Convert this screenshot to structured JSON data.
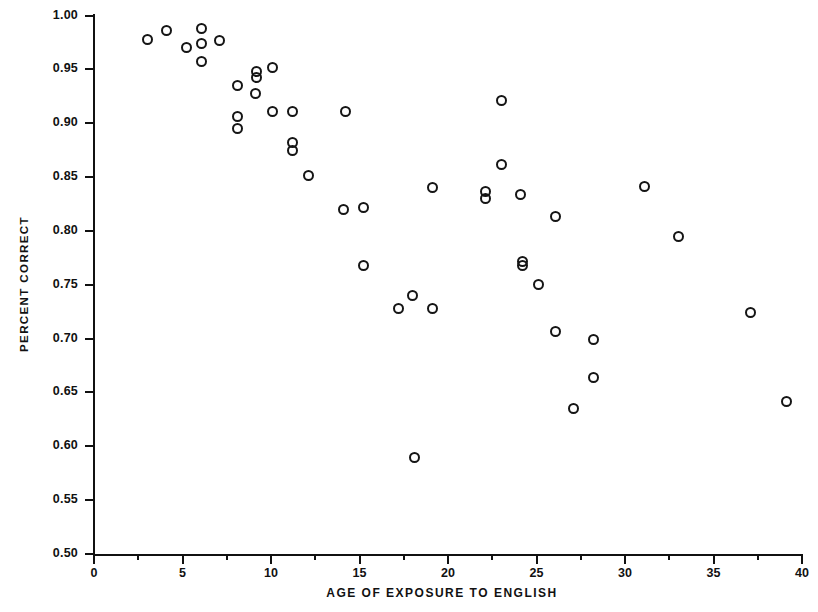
{
  "chart_data": {
    "type": "scatter",
    "title": "",
    "xlabel": "AGE OF EXPOSURE TO ENGLISH",
    "ylabel": "PERCENT CORRECT",
    "xlim": [
      0,
      40
    ],
    "ylim": [
      0.5,
      1.0
    ],
    "grid": false,
    "legend": null,
    "x_ticks": [
      {
        "value": 0,
        "label": "0",
        "major": true
      },
      {
        "value": 2.5,
        "label": "",
        "major": false
      },
      {
        "value": 5,
        "label": "5",
        "major": true
      },
      {
        "value": 7.5,
        "label": "",
        "major": false
      },
      {
        "value": 10,
        "label": "10",
        "major": true
      },
      {
        "value": 12.5,
        "label": "",
        "major": false
      },
      {
        "value": 15,
        "label": "15",
        "major": true
      },
      {
        "value": 17.5,
        "label": "",
        "major": false
      },
      {
        "value": 20,
        "label": "20",
        "major": true
      },
      {
        "value": 22.5,
        "label": "",
        "major": false
      },
      {
        "value": 25,
        "label": "25",
        "major": true
      },
      {
        "value": 27.5,
        "label": "",
        "major": false
      },
      {
        "value": 30,
        "label": "30",
        "major": true
      },
      {
        "value": 32.5,
        "label": "",
        "major": false
      },
      {
        "value": 35,
        "label": "35",
        "major": true
      },
      {
        "value": 37.5,
        "label": "",
        "major": false
      },
      {
        "value": 40,
        "label": "40",
        "major": true
      }
    ],
    "y_ticks": [
      {
        "value": 1.0,
        "label": "1.00"
      },
      {
        "value": 0.95,
        "label": "0.95"
      },
      {
        "value": 0.9,
        "label": "0.90"
      },
      {
        "value": 0.85,
        "label": "0.85"
      },
      {
        "value": 0.8,
        "label": "0.80"
      },
      {
        "value": 0.75,
        "label": "0.75"
      },
      {
        "value": 0.7,
        "label": "0.70"
      },
      {
        "value": 0.65,
        "label": "0.65"
      },
      {
        "value": 0.6,
        "label": "0.60"
      },
      {
        "value": 0.55,
        "label": "0.55"
      },
      {
        "value": 0.5,
        "label": "0.50"
      }
    ],
    "marker": {
      "shape": "open-circle",
      "color": "#151515",
      "size": 11
    },
    "points": [
      {
        "x": 3.0,
        "y": 0.978
      },
      {
        "x": 4.1,
        "y": 0.986
      },
      {
        "x": 5.2,
        "y": 0.97
      },
      {
        "x": 6.1,
        "y": 0.988
      },
      {
        "x": 6.1,
        "y": 0.974
      },
      {
        "x": 7.1,
        "y": 0.977
      },
      {
        "x": 6.1,
        "y": 0.957
      },
      {
        "x": 8.1,
        "y": 0.935
      },
      {
        "x": 8.1,
        "y": 0.906
      },
      {
        "x": 8.1,
        "y": 0.895
      },
      {
        "x": 9.1,
        "y": 0.928
      },
      {
        "x": 9.2,
        "y": 0.948
      },
      {
        "x": 9.2,
        "y": 0.942
      },
      {
        "x": 10.1,
        "y": 0.952
      },
      {
        "x": 10.1,
        "y": 0.911
      },
      {
        "x": 11.2,
        "y": 0.911
      },
      {
        "x": 11.2,
        "y": 0.882
      },
      {
        "x": 11.2,
        "y": 0.875
      },
      {
        "x": 12.1,
        "y": 0.851
      },
      {
        "x": 14.2,
        "y": 0.911
      },
      {
        "x": 14.1,
        "y": 0.82
      },
      {
        "x": 15.2,
        "y": 0.822
      },
      {
        "x": 15.2,
        "y": 0.768
      },
      {
        "x": 17.2,
        "y": 0.728
      },
      {
        "x": 18.0,
        "y": 0.74
      },
      {
        "x": 18.1,
        "y": 0.59
      },
      {
        "x": 19.1,
        "y": 0.728
      },
      {
        "x": 19.1,
        "y": 0.84
      },
      {
        "x": 22.1,
        "y": 0.837
      },
      {
        "x": 22.1,
        "y": 0.83
      },
      {
        "x": 23.0,
        "y": 0.921
      },
      {
        "x": 23.0,
        "y": 0.862
      },
      {
        "x": 24.1,
        "y": 0.834
      },
      {
        "x": 24.2,
        "y": 0.772
      },
      {
        "x": 24.2,
        "y": 0.768
      },
      {
        "x": 25.1,
        "y": 0.75
      },
      {
        "x": 26.1,
        "y": 0.813
      },
      {
        "x": 26.1,
        "y": 0.707
      },
      {
        "x": 27.1,
        "y": 0.635
      },
      {
        "x": 28.2,
        "y": 0.699
      },
      {
        "x": 28.2,
        "y": 0.664
      },
      {
        "x": 31.1,
        "y": 0.841
      },
      {
        "x": 33.0,
        "y": 0.795
      },
      {
        "x": 37.1,
        "y": 0.724
      },
      {
        "x": 39.1,
        "y": 0.642
      }
    ]
  }
}
